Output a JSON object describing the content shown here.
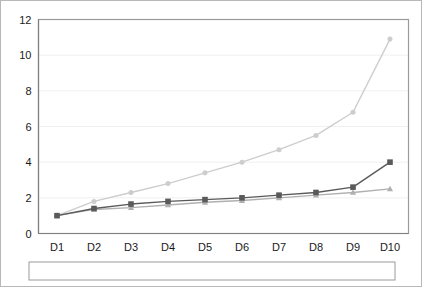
{
  "chart_data": {
    "type": "line",
    "title": "",
    "subtitle": "",
    "xlabel": "",
    "ylabel": "",
    "categories": [
      "D1",
      "D2",
      "D3",
      "D4",
      "D5",
      "D6",
      "D7",
      "D8",
      "D9",
      "D10"
    ],
    "ylim": [
      0,
      12
    ],
    "ytick_values": [
      0,
      2,
      4,
      6,
      8,
      10,
      12
    ],
    "ytick_labels": [
      "0",
      "2",
      "4",
      "6",
      "8",
      "10",
      "12"
    ],
    "grid": true,
    "grid_axis": "y",
    "legend_position": "bottom",
    "series": [
      {
        "name": "Household annual earnings",
        "color": "#cdcdcd",
        "marker": "circle",
        "values": [
          1.0,
          1.8,
          2.3,
          2.8,
          3.4,
          4.0,
          4.7,
          5.5,
          6.8,
          10.9
        ]
      },
      {
        "name": "Household hours",
        "color": "#b0b0b0",
        "marker": "triangle",
        "values": [
          1.0,
          1.35,
          1.45,
          1.6,
          1.75,
          1.85,
          2.0,
          2.15,
          2.3,
          2.5
        ]
      },
      {
        "name": "Household hourly earnings",
        "color": "#5a5a5a",
        "marker": "square",
        "values": [
          1.0,
          1.4,
          1.65,
          1.8,
          1.9,
          2.0,
          2.15,
          2.3,
          2.6,
          4.0
        ]
      }
    ]
  },
  "legend": {
    "entries": [
      {
        "label": "Household annual earnings"
      },
      {
        "label": "Household hours"
      },
      {
        "label": "Household hourly earnings"
      }
    ]
  }
}
